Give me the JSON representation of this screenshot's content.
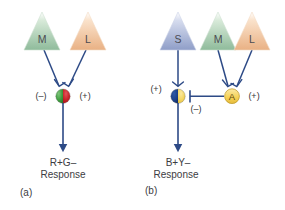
{
  "figure": {
    "background_color": "#ffffff",
    "line_color": "#2d4a86",
    "text_color": "#3c3c42"
  },
  "panels": [
    {
      "id": "panel-a",
      "label": "(a)",
      "response_line1": "R+G–",
      "response_line2": "Response",
      "cones": [
        {
          "letter": "M",
          "color": "#9dc3a6",
          "name": "cone-m"
        },
        {
          "letter": "L",
          "color": "#eebb8e",
          "name": "cone-l"
        }
      ],
      "ganglion": {
        "name": "ganglion-cell-red-green",
        "left_half_color": "#3f9e3f",
        "right_half_color": "#c62026",
        "left_sign": "(–)",
        "right_sign": "(+)"
      }
    },
    {
      "id": "panel-b",
      "label": "(b)",
      "response_line1": "B+Y–",
      "response_line2": "Response",
      "cones": [
        {
          "letter": "S",
          "color": "#9aa7ce",
          "name": "cone-s"
        },
        {
          "letter": "M",
          "color": "#9dc3a6",
          "name": "cone-m"
        },
        {
          "letter": "L",
          "color": "#eebb8e",
          "name": "cone-l"
        }
      ],
      "ganglion": {
        "name": "ganglion-cell-blue-yellow",
        "left_half_color": "#1b3f87",
        "right_half_color": "#f3d45c",
        "left_sign": "(+)",
        "inhibit_sign": "(–)"
      },
      "amacrine": {
        "name": "amacrine-cell-a",
        "letter": "A",
        "fill_color": "#f6d35a",
        "sign": "(+)"
      }
    }
  ]
}
